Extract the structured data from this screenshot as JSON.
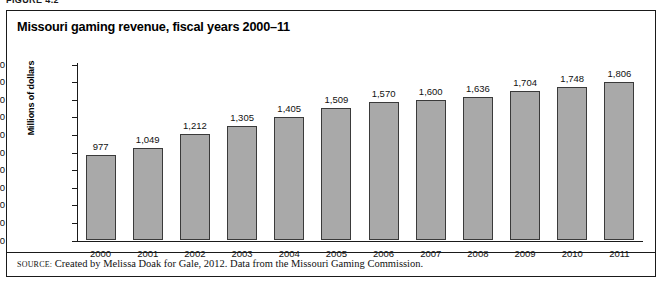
{
  "figure": {
    "caption_fragment": "FIGURE 4.2",
    "title": "Missouri gaming revenue, fiscal years 2000–11",
    "source_keyword": "SOURCE:",
    "source_text": " Created by Melissa Doak for Gale, 2012. Data from the Missouri Gaming Commission."
  },
  "colors": {
    "bar_fill": "#a9a9a9",
    "bar_stroke": "#3a3a3a",
    "frame": "#1a1a1a",
    "text": "#111111"
  },
  "chart_data": {
    "type": "bar",
    "title": "Missouri gaming revenue, fiscal years 2000–11",
    "xlabel": "",
    "ylabel": "Millions of dollars",
    "categories": [
      "2000",
      "2001",
      "2002",
      "2003",
      "2004",
      "2005",
      "2006",
      "2007",
      "2008",
      "2009",
      "2010",
      "2011"
    ],
    "values": [
      977,
      1049,
      1212,
      1305,
      1405,
      1509,
      1570,
      1600,
      1636,
      1704,
      1748,
      1806
    ],
    "value_labels": [
      "977",
      "1,049",
      "1,212",
      "1,305",
      "1,405",
      "1,509",
      "1,570",
      "1,600",
      "1,636",
      "1,704",
      "1,748",
      "1,806"
    ],
    "ylim": [
      0,
      2000
    ],
    "ytick_values": [
      0,
      200,
      400,
      600,
      800,
      1000,
      1200,
      1400,
      1600,
      1800,
      2000
    ],
    "ytick_labels": [
      "0",
      "200",
      "400",
      "600",
      "800",
      "1,000",
      "1,200",
      "1,400",
      "1,600",
      "1,800",
      "2,000"
    ],
    "grid": false,
    "legend": null,
    "legend_position": "none"
  }
}
